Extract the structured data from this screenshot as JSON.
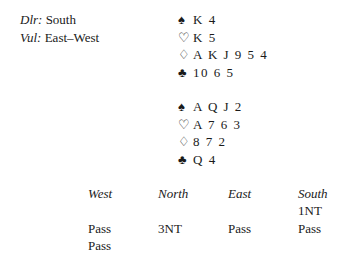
{
  "deal_info": {
    "dealer_label": "Dlr:",
    "dealer_value": " South",
    "vul_label": "Vul:",
    "vul_value": " East–West"
  },
  "north": {
    "spades": {
      "symbol": "♠",
      "cards": "K 4"
    },
    "hearts": {
      "symbol": "♡",
      "cards": "K 5"
    },
    "diamonds": {
      "symbol": "♢",
      "cards": "A K J 9 5 4"
    },
    "clubs": {
      "symbol": "♣",
      "cards": "10 6 5"
    }
  },
  "south": {
    "spades": {
      "symbol": "♠",
      "cards": "A Q J 2"
    },
    "hearts": {
      "symbol": "♡",
      "cards": "A 7 6 3"
    },
    "diamonds": {
      "symbol": "♢",
      "cards": "8 7 2"
    },
    "clubs": {
      "symbol": "♣",
      "cards": "Q 4"
    }
  },
  "auction": {
    "headers": [
      "West",
      "North",
      "East",
      "South"
    ],
    "rows": [
      [
        "",
        "",
        "",
        "1NT"
      ],
      [
        "Pass",
        "3NT",
        "Pass",
        "Pass"
      ],
      [
        "Pass",
        "",
        "",
        ""
      ]
    ]
  }
}
